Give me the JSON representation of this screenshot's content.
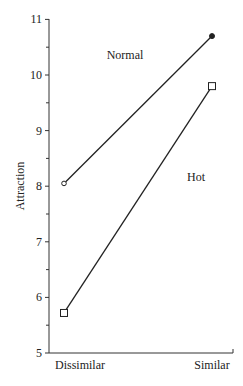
{
  "chart_data": {
    "type": "line",
    "title": "",
    "xlabel": "",
    "ylabel": "Attraction",
    "categories": [
      "Dissimilar",
      "Similar"
    ],
    "ylim": [
      5,
      11
    ],
    "yticks": [
      "5",
      "6",
      "7",
      "8",
      "9",
      "10",
      "11"
    ],
    "grid": false,
    "legend": "inline labels",
    "series": [
      {
        "name": "Normal",
        "values": [
          8.05,
          10.7
        ],
        "markers": [
          "open-circle",
          "filled-circle"
        ]
      },
      {
        "name": "Hot",
        "values": [
          5.72,
          9.8
        ],
        "markers": [
          "open-square",
          "open-square"
        ]
      }
    ]
  }
}
